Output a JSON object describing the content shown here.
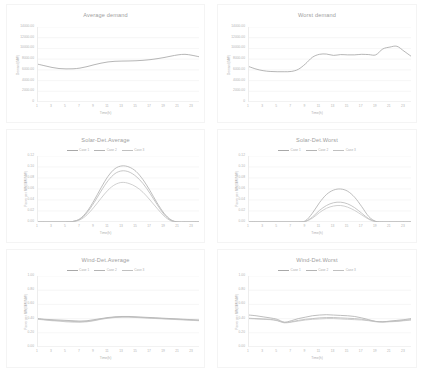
{
  "chart_data": [
    {
      "type": "line",
      "title": "Average demand",
      "xlabel": "Time(h)",
      "ylabel": "Demand(MW)",
      "xlim": [
        1,
        24
      ],
      "ylim": [
        0,
        14000
      ],
      "yticks": [
        "0",
        "2000.00",
        "4000.00",
        "6000.00",
        "8000.00",
        "10000.00",
        "12000.00",
        "14000.00"
      ],
      "ytick_values": [
        0,
        2000,
        4000,
        6000,
        8000,
        10000,
        12000,
        14000
      ],
      "xticks": [
        "1",
        "3",
        "5",
        "7",
        "9",
        "11",
        "13",
        "15",
        "17",
        "19",
        "21",
        "23"
      ],
      "grid": true,
      "legend": null,
      "series": [
        {
          "name": "Average demand",
          "color": "#9e9e9e",
          "x": [
            1,
            2,
            3,
            4,
            5,
            6,
            7,
            8,
            9,
            10,
            11,
            12,
            13,
            14,
            15,
            16,
            17,
            18,
            19,
            20,
            21,
            22,
            23,
            24
          ],
          "values": [
            7050,
            6750,
            6450,
            6250,
            6180,
            6200,
            6330,
            6600,
            6950,
            7250,
            7480,
            7600,
            7640,
            7660,
            7700,
            7780,
            7900,
            8080,
            8300,
            8560,
            8800,
            8900,
            8720,
            8450
          ]
        }
      ]
    },
    {
      "type": "line",
      "title": "Worst demand",
      "xlabel": "Time(h)",
      "ylabel": "Demand(MW)",
      "xlim": [
        1,
        24
      ],
      "ylim": [
        0,
        14000
      ],
      "yticks": [
        "0",
        "2000.00",
        "4000.00",
        "6000.00",
        "8000.00",
        "10000.00",
        "12000.00",
        "14000.00"
      ],
      "ytick_values": [
        0,
        2000,
        4000,
        6000,
        8000,
        10000,
        12000,
        14000
      ],
      "xticks": [
        "1",
        "3",
        "5",
        "7",
        "9",
        "11",
        "13",
        "15",
        "17",
        "19",
        "21",
        "23"
      ],
      "grid": true,
      "legend": null,
      "series": [
        {
          "name": "Worst demand",
          "color": "#9e9e9e",
          "x": [
            1,
            2,
            3,
            4,
            5,
            6,
            7,
            8,
            9,
            10,
            11,
            12,
            13,
            14,
            15,
            16,
            17,
            18,
            19,
            20,
            21,
            22,
            23,
            24
          ],
          "values": [
            6600,
            6150,
            5850,
            5700,
            5650,
            5650,
            5700,
            6100,
            7100,
            8350,
            8900,
            8950,
            8700,
            8850,
            8800,
            8800,
            8900,
            8850,
            8800,
            9900,
            10250,
            10400,
            9500,
            8550
          ]
        }
      ]
    },
    {
      "type": "line",
      "title": "Solar-Det.Average",
      "xlabel": "Time(h)",
      "ylabel": "Power per MW(MW/MW)",
      "xlim": [
        1,
        24
      ],
      "ylim": [
        0,
        0.12
      ],
      "yticks": [
        "0.00",
        "0.02",
        "0.04",
        "0.06",
        "0.08",
        "0.10",
        "0.12"
      ],
      "ytick_values": [
        0,
        0.02,
        0.04,
        0.06,
        0.08,
        0.1,
        0.12
      ],
      "xticks": [
        "1",
        "3",
        "5",
        "7",
        "9",
        "11",
        "13",
        "15",
        "17",
        "19",
        "21",
        "23"
      ],
      "grid": true,
      "legend": [
        "Case 1",
        "Case 2",
        "Case 3"
      ],
      "series": [
        {
          "name": "Case 1",
          "color": "#a8a8a8",
          "x": [
            1,
            2,
            3,
            4,
            5,
            6,
            7,
            8,
            9,
            10,
            11,
            12,
            13,
            14,
            15,
            16,
            17,
            18,
            19,
            20,
            21,
            22,
            23,
            24
          ],
          "values": [
            0,
            0,
            0,
            0,
            0,
            0.001,
            0.006,
            0.019,
            0.039,
            0.062,
            0.083,
            0.097,
            0.102,
            0.1,
            0.092,
            0.077,
            0.057,
            0.035,
            0.016,
            0.004,
            0,
            0,
            0,
            0
          ]
        },
        {
          "name": "Case 2",
          "color": "#b4b4b4",
          "x": [
            1,
            2,
            3,
            4,
            5,
            6,
            7,
            8,
            9,
            10,
            11,
            12,
            13,
            14,
            15,
            16,
            17,
            18,
            19,
            20,
            21,
            22,
            23,
            24
          ],
          "values": [
            0,
            0,
            0,
            0,
            0,
            0.001,
            0.005,
            0.017,
            0.035,
            0.056,
            0.075,
            0.088,
            0.093,
            0.091,
            0.083,
            0.07,
            0.052,
            0.032,
            0.014,
            0.003,
            0,
            0,
            0,
            0
          ]
        },
        {
          "name": "Case 3",
          "color": "#c0c0c0",
          "x": [
            1,
            2,
            3,
            4,
            5,
            6,
            7,
            8,
            9,
            10,
            11,
            12,
            13,
            14,
            15,
            16,
            17,
            18,
            19,
            20,
            21,
            22,
            23,
            24
          ],
          "values": [
            0,
            0,
            0,
            0,
            0,
            0.001,
            0.004,
            0.013,
            0.027,
            0.043,
            0.058,
            0.068,
            0.072,
            0.07,
            0.064,
            0.054,
            0.04,
            0.025,
            0.011,
            0.002,
            0,
            0,
            0,
            0
          ]
        }
      ]
    },
    {
      "type": "line",
      "title": "Solar-Det.Worst",
      "xlabel": "Time(h)",
      "ylabel": "Power per MW(MW/MW)",
      "xlim": [
        1,
        24
      ],
      "ylim": [
        0,
        0.12
      ],
      "yticks": [
        "0.00",
        "0.02",
        "0.04",
        "0.06",
        "0.08",
        "0.10",
        "0.12"
      ],
      "ytick_values": [
        0,
        0.02,
        0.04,
        0.06,
        0.08,
        0.1,
        0.12
      ],
      "xticks": [
        "1",
        "3",
        "5",
        "7",
        "9",
        "11",
        "13",
        "15",
        "17",
        "19",
        "21",
        "23"
      ],
      "grid": true,
      "legend": [
        "Case 1",
        "Case 2",
        "Case 3"
      ],
      "series": [
        {
          "name": "Case 1",
          "color": "#a8a8a8",
          "x": [
            1,
            2,
            3,
            4,
            5,
            6,
            7,
            8,
            9,
            10,
            11,
            12,
            13,
            14,
            15,
            16,
            17,
            18,
            19,
            20,
            21,
            22,
            23,
            24
          ],
          "values": [
            0,
            0,
            0,
            0,
            0,
            0,
            0,
            0,
            0.002,
            0.016,
            0.035,
            0.05,
            0.058,
            0.06,
            0.056,
            0.045,
            0.028,
            0.01,
            0.001,
            0,
            0,
            0,
            0,
            0
          ]
        },
        {
          "name": "Case 2",
          "color": "#b4b4b4",
          "x": [
            1,
            2,
            3,
            4,
            5,
            6,
            7,
            8,
            9,
            10,
            11,
            12,
            13,
            14,
            15,
            16,
            17,
            18,
            19,
            20,
            21,
            22,
            23,
            24
          ],
          "values": [
            0,
            0,
            0,
            0,
            0,
            0,
            0,
            0,
            0.001,
            0.009,
            0.021,
            0.03,
            0.035,
            0.036,
            0.033,
            0.026,
            0.016,
            0.006,
            0.001,
            0,
            0,
            0,
            0,
            0
          ]
        },
        {
          "name": "Case 3",
          "color": "#c0c0c0",
          "x": [
            1,
            2,
            3,
            4,
            5,
            6,
            7,
            8,
            9,
            10,
            11,
            12,
            13,
            14,
            15,
            16,
            17,
            18,
            19,
            20,
            21,
            22,
            23,
            24
          ],
          "values": [
            0,
            0,
            0,
            0,
            0,
            0,
            0,
            0,
            0.001,
            0.007,
            0.017,
            0.025,
            0.029,
            0.03,
            0.027,
            0.021,
            0.013,
            0.005,
            0,
            0,
            0,
            0,
            0,
            0
          ]
        }
      ]
    },
    {
      "type": "line",
      "title": "Wind-Det.Average",
      "xlabel": "Time(h)",
      "ylabel": "Power per MW(MW/MW)",
      "xlim": [
        1,
        24
      ],
      "ylim": [
        0,
        1.0
      ],
      "yticks": [
        "0.00",
        "0.20",
        "0.40",
        "0.60",
        "0.80",
        "1.00"
      ],
      "ytick_values": [
        0,
        0.2,
        0.4,
        0.6,
        0.8,
        1.0
      ],
      "xticks": [
        "1",
        "3",
        "5",
        "7",
        "9",
        "11",
        "13",
        "15",
        "17",
        "19",
        "21",
        "23"
      ],
      "grid": true,
      "legend": [
        "Case 1",
        "Case 2",
        "Case 3"
      ],
      "series": [
        {
          "name": "Case 1",
          "color": "#a8a8a8",
          "x": [
            1,
            2,
            3,
            4,
            5,
            6,
            7,
            8,
            9,
            10,
            11,
            12,
            13,
            14,
            15,
            16,
            17,
            18,
            19,
            20,
            21,
            22,
            23,
            24
          ],
          "values": [
            0.4,
            0.39,
            0.385,
            0.38,
            0.375,
            0.37,
            0.365,
            0.37,
            0.385,
            0.4,
            0.415,
            0.425,
            0.43,
            0.43,
            0.425,
            0.42,
            0.415,
            0.41,
            0.405,
            0.4,
            0.395,
            0.39,
            0.385,
            0.38
          ]
        },
        {
          "name": "Case 2",
          "color": "#b4b4b4",
          "x": [
            1,
            2,
            3,
            4,
            5,
            6,
            7,
            8,
            9,
            10,
            11,
            12,
            13,
            14,
            15,
            16,
            17,
            18,
            19,
            20,
            21,
            22,
            23,
            24
          ],
          "values": [
            0.395,
            0.385,
            0.375,
            0.37,
            0.365,
            0.36,
            0.355,
            0.36,
            0.375,
            0.395,
            0.41,
            0.42,
            0.425,
            0.425,
            0.42,
            0.415,
            0.41,
            0.405,
            0.4,
            0.395,
            0.39,
            0.385,
            0.38,
            0.375
          ]
        },
        {
          "name": "Case 3",
          "color": "#c0c0c0",
          "x": [
            1,
            2,
            3,
            4,
            5,
            6,
            7,
            8,
            9,
            10,
            11,
            12,
            13,
            14,
            15,
            16,
            17,
            18,
            19,
            20,
            21,
            22,
            23,
            24
          ],
          "values": [
            0.39,
            0.38,
            0.37,
            0.365,
            0.355,
            0.35,
            0.35,
            0.355,
            0.37,
            0.39,
            0.405,
            0.415,
            0.42,
            0.42,
            0.415,
            0.41,
            0.405,
            0.4,
            0.395,
            0.39,
            0.385,
            0.38,
            0.375,
            0.37
          ]
        }
      ]
    },
    {
      "type": "line",
      "title": "Wind-Det.Worst",
      "xlabel": "Time(h)",
      "ylabel": "Power per MW(MW/MW)",
      "xlim": [
        1,
        24
      ],
      "ylim": [
        0,
        1.0
      ],
      "yticks": [
        "0.00",
        "0.20",
        "0.40",
        "0.60",
        "0.80",
        "1.00"
      ],
      "ytick_values": [
        0,
        0.2,
        0.4,
        0.6,
        0.8,
        1.0
      ],
      "xticks": [
        "1",
        "3",
        "5",
        "7",
        "9",
        "11",
        "13",
        "15",
        "17",
        "19",
        "21",
        "23"
      ],
      "grid": true,
      "legend": [
        "Case 1",
        "Case 2",
        "Case 3"
      ],
      "series": [
        {
          "name": "Case 1",
          "color": "#a8a8a8",
          "x": [
            1,
            2,
            3,
            4,
            5,
            6,
            7,
            8,
            9,
            10,
            11,
            12,
            13,
            14,
            15,
            16,
            17,
            18,
            19,
            20,
            21,
            22,
            23,
            24
          ],
          "values": [
            0.45,
            0.44,
            0.425,
            0.41,
            0.39,
            0.35,
            0.37,
            0.4,
            0.42,
            0.44,
            0.45,
            0.455,
            0.45,
            0.445,
            0.44,
            0.43,
            0.41,
            0.385,
            0.36,
            0.355,
            0.365,
            0.375,
            0.385,
            0.4
          ]
        },
        {
          "name": "Case 2",
          "color": "#b4b4b4",
          "x": [
            1,
            2,
            3,
            4,
            5,
            6,
            7,
            8,
            9,
            10,
            11,
            12,
            13,
            14,
            15,
            16,
            17,
            18,
            19,
            20,
            21,
            22,
            23,
            24
          ],
          "values": [
            0.405,
            0.4,
            0.395,
            0.39,
            0.375,
            0.345,
            0.355,
            0.375,
            0.39,
            0.4,
            0.41,
            0.415,
            0.415,
            0.41,
            0.405,
            0.4,
            0.39,
            0.375,
            0.36,
            0.355,
            0.36,
            0.365,
            0.375,
            0.385
          ]
        },
        {
          "name": "Case 3",
          "color": "#c0c0c0",
          "x": [
            1,
            2,
            3,
            4,
            5,
            6,
            7,
            8,
            9,
            10,
            11,
            12,
            13,
            14,
            15,
            16,
            17,
            18,
            19,
            20,
            21,
            22,
            23,
            24
          ],
          "values": [
            0.4,
            0.395,
            0.39,
            0.385,
            0.37,
            0.34,
            0.35,
            0.365,
            0.38,
            0.39,
            0.395,
            0.4,
            0.4,
            0.395,
            0.39,
            0.385,
            0.38,
            0.37,
            0.355,
            0.35,
            0.355,
            0.36,
            0.37,
            0.38
          ]
        }
      ]
    }
  ]
}
